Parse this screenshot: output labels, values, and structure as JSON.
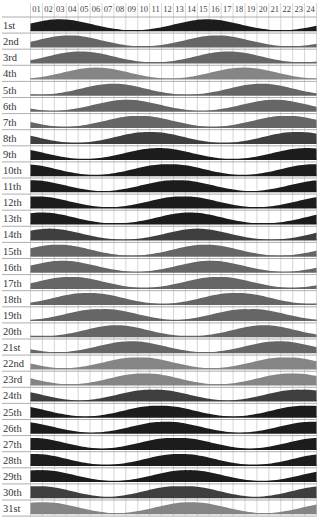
{
  "chart_data": {
    "type": "area",
    "title": "",
    "xlabel": "Hour",
    "ylabel": "Day of month",
    "hours": [
      "01",
      "02",
      "03",
      "04",
      "05",
      "06",
      "07",
      "08",
      "09",
      "10",
      "11",
      "12",
      "13",
      "14",
      "15",
      "16",
      "17",
      "18",
      "19",
      "20",
      "21",
      "22",
      "23",
      "24"
    ],
    "days": [
      {
        "label": "1st",
        "peaks": [
          2.5,
          14.8
        ],
        "shade": "dark"
      },
      {
        "label": "2nd",
        "peaks": [
          3.3,
          15.6
        ],
        "shade": "mid"
      },
      {
        "label": "3rd",
        "peaks": [
          4.3,
          16.5
        ],
        "shade": "mid"
      },
      {
        "label": "4th",
        "peaks": [
          5.6,
          17.8
        ],
        "shade": "light"
      },
      {
        "label": "5th",
        "peaks": [
          7.0,
          19.3
        ],
        "shade": "mid"
      },
      {
        "label": "6th",
        "peaks": [
          8.0,
          20.6
        ],
        "shade": "mid"
      },
      {
        "label": "7th",
        "peaks": [
          8.9,
          21.7
        ],
        "shade": "mid"
      },
      {
        "label": "8th",
        "peaks": [
          9.8,
          22.6
        ],
        "shade": "middark"
      },
      {
        "label": "9th",
        "peaks": [
          10.6,
          23.3
        ],
        "shade": "dark"
      },
      {
        "label": "10th",
        "peaks": [
          11.3,
          24.3
        ],
        "shade": "dark"
      },
      {
        "label": "11th",
        "peaks": [
          0.2,
          12.0
        ],
        "shade": "dark"
      },
      {
        "label": "12th",
        "peaks": [
          0.6,
          12.6
        ],
        "shade": "dark"
      },
      {
        "label": "13th",
        "peaks": [
          1.0,
          13.3
        ],
        "shade": "dark"
      },
      {
        "label": "14th",
        "peaks": [
          1.6,
          14.0
        ],
        "shade": "middark"
      },
      {
        "label": "15th",
        "peaks": [
          2.4,
          14.6
        ],
        "shade": "mid"
      },
      {
        "label": "16th",
        "peaks": [
          2.6,
          15.2
        ],
        "shade": "mid"
      },
      {
        "label": "17th",
        "peaks": [
          3.5,
          15.6
        ],
        "shade": "mid"
      },
      {
        "label": "18th",
        "peaks": [
          4.6,
          17.5
        ],
        "shade": "mid"
      },
      {
        "label": "19th",
        "peaks": [
          5.6,
          18.7
        ],
        "shade": "mid"
      },
      {
        "label": "20th",
        "peaks": [
          7.2,
          19.6
        ],
        "shade": "mid"
      },
      {
        "label": "21st",
        "peaks": [
          8.3,
          21.0
        ],
        "shade": "mid"
      },
      {
        "label": "22nd",
        "peaks": [
          8.8,
          21.7
        ],
        "shade": "light"
      },
      {
        "label": "23rd",
        "peaks": [
          9.3,
          22.2
        ],
        "shade": "light"
      },
      {
        "label": "24th",
        "peaks": [
          10.0,
          23.0
        ],
        "shade": "middark"
      },
      {
        "label": "25th",
        "peaks": [
          10.5,
          23.5
        ],
        "shade": "dark"
      },
      {
        "label": "26th",
        "peaks": [
          11.1,
          24.0
        ],
        "shade": "dark"
      },
      {
        "label": "27th",
        "peaks": [
          0.2,
          11.8
        ],
        "shade": "dark"
      },
      {
        "label": "28th",
        "peaks": [
          0.4,
          12.3
        ],
        "shade": "dark"
      },
      {
        "label": "29th",
        "peaks": [
          1.0,
          13.0
        ],
        "shade": "dark"
      },
      {
        "label": "30th",
        "peaks": [
          0.8,
          12.2
        ],
        "shade": "middark"
      },
      {
        "label": "31st",
        "peaks": [
          1.3,
          13.2
        ],
        "shade": "light"
      }
    ],
    "grid": true,
    "legend": "none"
  },
  "colors": {
    "dark": "#1c1c1c",
    "middark": "#3f3f3f",
    "mid": "#666666",
    "light": "#858585",
    "grid": "#cccccc",
    "row_line": "#9a9a9a",
    "text": "#333333"
  }
}
